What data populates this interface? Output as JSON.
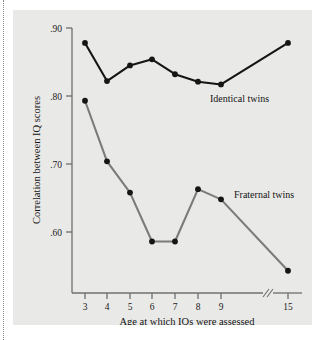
{
  "chart_data": {
    "type": "line",
    "title": "",
    "xlabel": "Age at which IQs were assessed",
    "ylabel": "Correlation between IQ scores",
    "x_tick_labels": [
      "3",
      "4",
      "5",
      "6",
      "7",
      "8",
      "9",
      "15"
    ],
    "x_values": [
      3,
      4,
      5,
      6,
      7,
      8,
      9,
      15
    ],
    "x_axis_break": true,
    "x_axis_break_label": "//",
    "y_tick_labels": [
      ".90",
      ".80",
      ".70",
      ".60"
    ],
    "y_ticks": [
      0.9,
      0.8,
      0.7,
      0.6
    ],
    "ylim": [
      0.53,
      0.92
    ],
    "grid": false,
    "legend_position": "inline-right",
    "series": [
      {
        "name": "Identical twins",
        "color": "#151515",
        "values": [
          0.878,
          0.822,
          0.845,
          0.854,
          0.832,
          0.821,
          0.817,
          0.878
        ]
      },
      {
        "name": "Fraternal twins",
        "color": "#7b7b7b",
        "values": [
          0.793,
          0.704,
          0.658,
          0.586,
          0.586,
          0.663,
          0.648,
          0.543
        ]
      }
    ],
    "annotations": [
      {
        "text": "Identical twins",
        "series": "Identical twins"
      },
      {
        "text": "Fraternal twins",
        "series": "Fraternal twins"
      }
    ]
  },
  "figure": {
    "panel_background": "#e9e9e7",
    "page_background": "#ffffff",
    "axis_color": "#6f6f6f"
  }
}
